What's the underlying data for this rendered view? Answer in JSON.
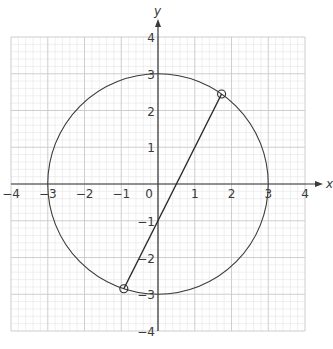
{
  "diagram": {
    "type": "coordinate-plane",
    "axes": {
      "x_label": "x",
      "y_label": "y",
      "x_range": [
        -4,
        4
      ],
      "y_range": [
        -4,
        4
      ],
      "x_ticks": [
        -4,
        -3,
        -2,
        -1,
        0,
        1,
        2,
        3,
        4
      ],
      "y_ticks": [
        4,
        3,
        2,
        1,
        -1,
        -2,
        -3,
        -4
      ],
      "origin_label": "0",
      "minor_divisions_per_unit": 5,
      "grid": true
    },
    "shapes": [
      {
        "kind": "circle",
        "center": [
          0,
          0
        ],
        "radius": 3,
        "equation": "x^2 + y^2 = 9"
      },
      {
        "kind": "line_segment",
        "equation": "y = 2x - 1",
        "from": [
          -0.93,
          -2.85
        ],
        "to": [
          1.73,
          2.45
        ]
      }
    ],
    "marked_points": [
      {
        "x": 1.73,
        "y": 2.45,
        "marker": "open-circle"
      },
      {
        "x": -0.93,
        "y": -2.85,
        "marker": "open-circle"
      }
    ],
    "colors": {
      "background": "#ffffff",
      "minor_grid": "#e4e4e4",
      "major_grid": "#c8c8c8",
      "axis": "#3a3a3a",
      "curve": "#3a3a3a",
      "line": "#2a2a2a"
    }
  }
}
